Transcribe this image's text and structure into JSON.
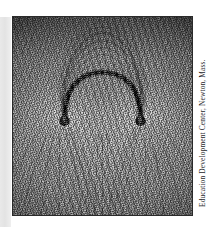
{
  "page": {
    "background_color": "#ffffff",
    "gutter_strip_color": "#e6e6e6"
  },
  "figure": {
    "name": "iron-filings-magnetic-field-photograph",
    "border_color": "#2a2a2a",
    "frame": {
      "x": 12,
      "y": 16,
      "width": 181,
      "height": 200
    },
    "subject": {
      "object": "horseshoe magnet",
      "magnet_color": "#111111",
      "left_pole": {
        "x": 0.29,
        "y": 0.52
      },
      "right_pole": {
        "x": 0.71,
        "y": 0.52
      },
      "arc_apex": {
        "x": 0.5,
        "y": 0.36
      },
      "field_line_arc_apex": {
        "x": 0.5,
        "y": 0.12
      }
    }
  },
  "credit": {
    "text": "Education Development Center, Newton, Mass.",
    "orientation": "rotated-90-ccw",
    "color": "#26262a"
  }
}
